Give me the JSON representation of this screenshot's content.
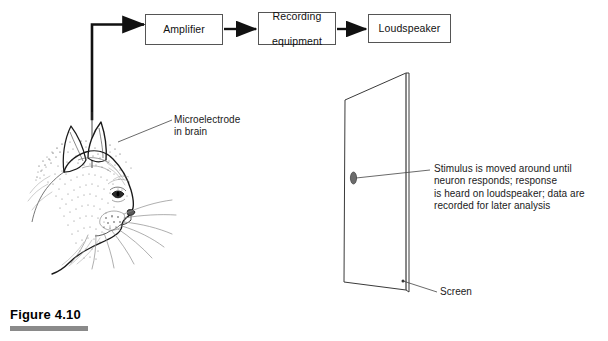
{
  "figure": {
    "caption": "Figure 4.10"
  },
  "flow": {
    "boxes": [
      {
        "id": "amplifier",
        "label": "Amplifier",
        "lines": [
          "Amplifier"
        ]
      },
      {
        "id": "recording",
        "label": "Recording equipment",
        "lines": [
          "Recording",
          "equipment"
        ]
      },
      {
        "id": "loudspeaker",
        "label": "Loudspeaker",
        "lines": [
          "Loudspeaker"
        ]
      }
    ]
  },
  "annotations": {
    "microelectrode": {
      "lines": [
        "Microelectrode",
        "in brain"
      ]
    },
    "stimulus": {
      "lines": [
        "Stimulus is moved around until",
        "neuron responds; response",
        "is heard on loudspeaker; data are",
        "recorded for later analysis"
      ]
    },
    "screen": {
      "lines": [
        "Screen"
      ]
    }
  },
  "illustration": {
    "cat": "cat-head-profile-line-art",
    "electrode": "microelectrode-wire",
    "screen": "perspective-screen-panel",
    "stimulus_dot": "stimulus-spot"
  },
  "colors": {
    "ink": "#1a1a1a",
    "box_border": "#555555",
    "rule_gray": "#8a8a8a",
    "paper": "#ffffff"
  }
}
